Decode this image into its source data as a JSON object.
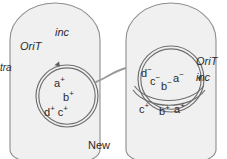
{
  "figure": {
    "caption": "New",
    "colors": {
      "cell_fill": "#f0f0f0",
      "cell_stroke": "#8e8e8e",
      "plasmid_stroke": "#6e6e6e",
      "bridge_stroke": "#9a9a9a",
      "text": "#2b2b2b",
      "background": "#ffffff"
    },
    "donor_cell": {
      "name": "donor-cell",
      "annotations": {
        "inc": "inc",
        "orit": "OriT",
        "tra": "tra"
      },
      "plasmid_genes": [
        {
          "gene": "a",
          "allele": "+",
          "label": "a+"
        },
        {
          "gene": "b",
          "allele": "+",
          "label": "b+"
        },
        {
          "gene": "d",
          "allele": "+",
          "label": "d+"
        },
        {
          "gene": "c",
          "allele": "+",
          "label": "c+"
        }
      ],
      "gene_text": {
        "a_plus": "a",
        "b_plus": "b",
        "d_plus": "d",
        "c_plus": "c",
        "plus": "+"
      }
    },
    "recipient_cell": {
      "name": "recipient-cell",
      "annotations": {
        "orit": "OriT",
        "inc": "inc"
      },
      "resident_plasmid_genes": [
        {
          "gene": "d",
          "allele": "-",
          "label": "d-"
        },
        {
          "gene": "c",
          "allele": "-",
          "label": "c-"
        },
        {
          "gene": "b",
          "allele": "-",
          "label": "b-"
        },
        {
          "gene": "a",
          "allele": "-",
          "label": "a-"
        }
      ],
      "transferred_strand_genes": [
        {
          "gene": "c",
          "allele": "+",
          "label": "c+"
        },
        {
          "gene": "b",
          "allele": "+",
          "label": "b+"
        },
        {
          "gene": "a",
          "allele": "+",
          "label": "a+"
        }
      ],
      "gene_text": {
        "d_minus": "d",
        "c_minus": "c",
        "b_minus": "b",
        "a_minus": "a",
        "minus": "−",
        "c_plus": "c",
        "b_plus": "b",
        "a_plus": "a",
        "plus": "+"
      }
    },
    "bridge": {
      "name": "conjugation-bridge"
    }
  }
}
